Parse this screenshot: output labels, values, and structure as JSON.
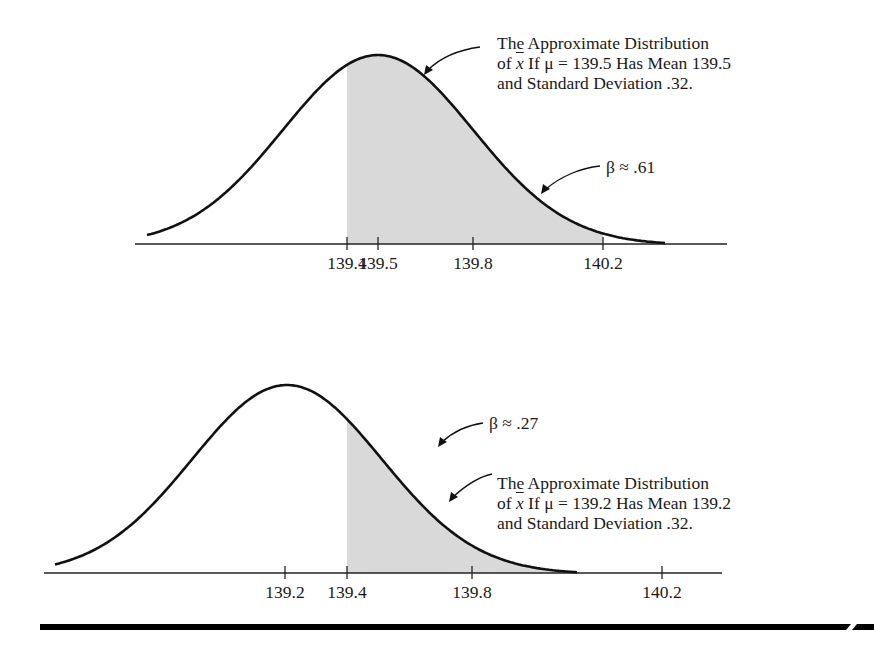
{
  "figure": {
    "type": "two normal sampling distributions with shaded beta (Type II error) regions",
    "rule_color": "#000000",
    "shade_color": "#d9d9d9",
    "curve_color": "#111111"
  },
  "chart_data": [
    {
      "type": "area",
      "title": "The Approximate Distribution of x̄ If μ = 139.5 Has Mean 139.5 and Standard Deviation .32.",
      "mean": 139.5,
      "sd": 0.32,
      "shaded_from": 139.4,
      "shaded_label": "β ≈ .61",
      "beta": 0.61,
      "xticks": [
        "139.4",
        "139.5",
        "139.8",
        "140.2"
      ],
      "xtick_values": [
        139.4,
        139.5,
        139.8,
        140.2
      ],
      "xlabel": "",
      "ylabel": "",
      "grid": false
    },
    {
      "type": "area",
      "title": "The Approximate Distribution of x̄ If μ = 139.2 Has Mean 139.2 and Standard Deviation .32.",
      "mean": 139.2,
      "sd": 0.32,
      "shaded_from": 139.4,
      "shaded_label": "β ≈ .27",
      "beta": 0.27,
      "xticks": [
        "139.2",
        "139.4",
        "139.8",
        "140.2"
      ],
      "xtick_values": [
        139.2,
        139.4,
        139.8,
        140.2
      ],
      "xlabel": "",
      "ylabel": "",
      "grid": false
    }
  ],
  "top": {
    "annotation": {
      "line1": "The Approximate Distribution",
      "line2_pre": "of ",
      "line2_var": "x",
      "line2_post": " If μ = 139.5 Has Mean 139.5",
      "line3": "and Standard Deviation .32."
    },
    "beta_label": "β ≈ .61",
    "ticks": [
      {
        "label": "139.4",
        "x": 347
      },
      {
        "label": "139.5",
        "x": 378
      },
      {
        "label": "139.8",
        "x": 473
      },
      {
        "label": "140.2",
        "x": 603
      }
    ]
  },
  "bottom": {
    "annotation": {
      "line1": "The Approximate Distribution",
      "line2_pre": "of ",
      "line2_var": "x",
      "line2_post": " If μ = 139.2 Has Mean 139.2",
      "line3": "and Standard Deviation .32."
    },
    "beta_label": "β ≈ .27",
    "ticks": [
      {
        "label": "139.2",
        "x": 285
      },
      {
        "label": "139.4",
        "x": 347
      },
      {
        "label": "139.8",
        "x": 472
      },
      {
        "label": "140.2",
        "x": 662
      }
    ]
  }
}
